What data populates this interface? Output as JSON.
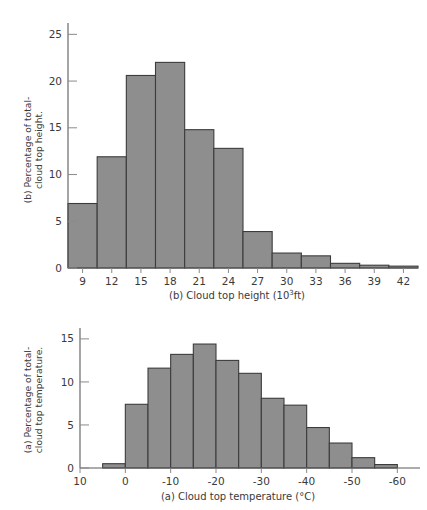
{
  "figure": {
    "background_color": "#ffffff",
    "bar_fill_color": "#8e8e8e",
    "bar_stroke_color": "#3c3c3c",
    "axis_color": "#5a5a5a"
  },
  "chart_data": [
    {
      "id": "panel-b",
      "type": "bar",
      "title": "",
      "xlabel": "(b) Cloud top height (10³ft)",
      "ylabel": "(b) Percentage of total- cloud top height.",
      "ylabel_line1": "(b) Percentage of total-",
      "ylabel_line2": "cloud top height.",
      "categories": [
        "9",
        "12",
        "15",
        "18",
        "21",
        "24",
        "27",
        "30",
        "33",
        "36",
        "39",
        "42"
      ],
      "xticks": [
        9,
        12,
        15,
        18,
        21,
        24,
        27,
        30,
        33,
        36,
        39,
        42
      ],
      "xtick_labels": [
        "9",
        "12",
        "15",
        "18",
        "21",
        "24",
        "27",
        "30",
        "33",
        "36",
        "39",
        "42"
      ],
      "yticks": [
        0,
        5,
        10,
        15,
        20,
        25
      ],
      "ytick_labels": [
        "0",
        "5",
        "10",
        "15",
        "20",
        "25"
      ],
      "values": [
        6.9,
        11.9,
        20.6,
        22.0,
        14.8,
        12.8,
        3.9,
        1.6,
        1.3,
        0.5,
        0.3,
        0.2
      ],
      "xlim": [
        7.5,
        43.5
      ],
      "ylim": [
        0,
        26
      ],
      "grid": false,
      "legend": false
    },
    {
      "id": "panel-a",
      "type": "bar",
      "title": "",
      "xlabel": "(a) Cloud top temperature (°C)",
      "ylabel": "(a) Percentage of total- cloud top temperature.",
      "ylabel_line1": "(a) Percentage of total-",
      "ylabel_line2": "cloud top temperature.",
      "categories": [
        "2.5",
        "-2.5",
        "-7.5",
        "-12.5",
        "-17.5",
        "-22.5",
        "-27.5",
        "-32.5",
        "-37.5",
        "-42.5",
        "-47.5",
        "-52.5",
        "-57.5"
      ],
      "xticks": [
        10,
        0,
        -10,
        -20,
        -30,
        -40,
        -50,
        -60
      ],
      "xtick_labels": [
        "10",
        "0",
        "-10",
        "-20",
        "-30",
        "-40",
        "-50",
        "-60"
      ],
      "yticks": [
        0,
        5,
        10,
        15
      ],
      "ytick_labels": [
        "0",
        "5",
        "10",
        "15"
      ],
      "values": [
        0.5,
        7.4,
        11.6,
        13.2,
        14.4,
        12.5,
        11.0,
        8.1,
        7.3,
        4.7,
        2.9,
        1.2,
        0.4
      ],
      "bin_edges": [
        5,
        0,
        -5,
        -10,
        -15,
        -20,
        -25,
        -30,
        -35,
        -40,
        -45,
        -50,
        -55,
        -60
      ],
      "xlim": [
        10,
        -65
      ],
      "ylim": [
        0,
        15.8
      ],
      "grid": false,
      "legend": false
    }
  ]
}
